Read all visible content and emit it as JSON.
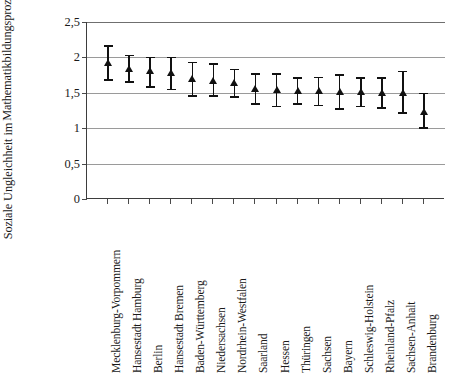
{
  "chart_data": {
    "type": "scatter",
    "title": "",
    "xlabel": "",
    "ylabel_lines": [
      "Soziale Ungleichheit im",
      "Mathematikbildungsprozess"
    ],
    "ylabel": "Soziale Ungleichheit im Mathematikbildungsprozess",
    "ylim": [
      0,
      2.5
    ],
    "ytick_labels": [
      "2,5",
      "2",
      "1,5",
      "1",
      "0,5",
      "0"
    ],
    "ytick_values": [
      2.5,
      2.0,
      1.5,
      1.0,
      0.5,
      0.0
    ],
    "grid": true,
    "legend": "none",
    "error_bar_style": "capped-vertical",
    "marker": "triangle",
    "marker_color": "#111111",
    "line_color": "#111111",
    "grid_color": "#9a9a9a",
    "axis_color": "#3d3d3d",
    "categories": [
      "Mecklenburg-Vorpommern",
      "Hansestadt Hamburg",
      "Berlin",
      "Hansestadt Bremen",
      "Baden-Württemberg",
      "Niedersachsen",
      "Nordrhein-Westfalen",
      "Saarland",
      "Hessen",
      "Thüringen",
      "Sachsen",
      "Bayern",
      "Schleswig-Holstein",
      "Rheinland-Pfalz",
      "Sachsen-Anhalt",
      "Brandenburg"
    ],
    "values": [
      1.93,
      1.85,
      1.81,
      1.79,
      1.7,
      1.68,
      1.64,
      1.56,
      1.55,
      1.53,
      1.53,
      1.52,
      1.52,
      1.51,
      1.51,
      1.23
    ],
    "err_low": [
      1.69,
      1.66,
      1.59,
      1.56,
      1.47,
      1.47,
      1.45,
      1.35,
      1.32,
      1.35,
      1.33,
      1.28,
      1.32,
      1.3,
      1.23,
      1.01
    ],
    "err_high": [
      2.17,
      2.04,
      2.01,
      2.01,
      1.94,
      1.92,
      1.84,
      1.78,
      1.78,
      1.72,
      1.73,
      1.76,
      1.72,
      1.72,
      1.81,
      1.5
    ]
  }
}
